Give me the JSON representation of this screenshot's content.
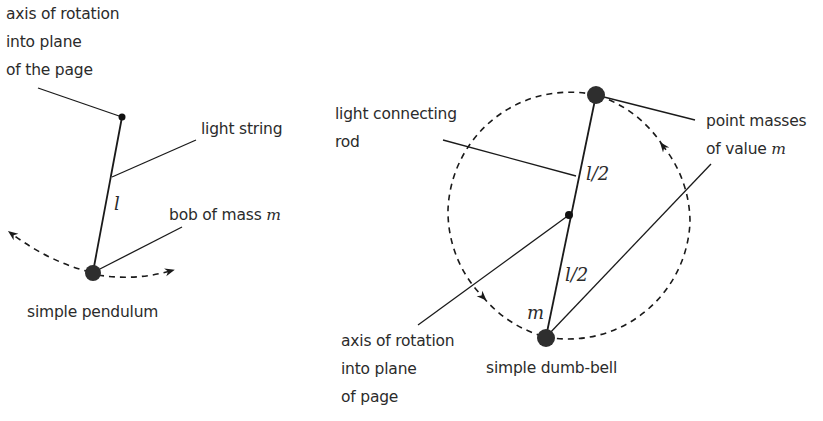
{
  "pendulum": {
    "axis_label_lines": [
      "axis of rotation",
      "into plane",
      "of the page"
    ],
    "string_label": "light string",
    "length_symbol": "l",
    "bob_label_prefix": "bob of mass ",
    "bob_label_var": "m",
    "caption": "simple pendulum"
  },
  "dumbbell": {
    "rod_label_lines": [
      "light connecting",
      "rod"
    ],
    "upper_half_symbol": "l/2",
    "lower_half_symbol": "l/2",
    "mass_symbol": "m",
    "masses_label_line1": "point masses",
    "masses_label_prefix": "of value ",
    "masses_label_var": "m",
    "axis_label_lines": [
      "axis of rotation",
      "into plane",
      "of page"
    ],
    "caption": "simple dumb-bell"
  },
  "colors": {
    "line": "#1a1a1a",
    "mass": "#2e2e2e",
    "text": "#2b2b2b"
  }
}
